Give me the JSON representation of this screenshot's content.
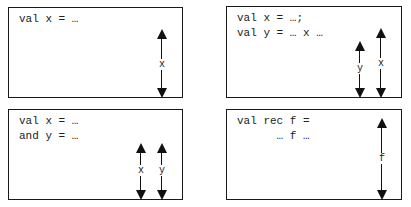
{
  "panels": [
    {
      "id": "simple-val",
      "code": [
        "val x = …"
      ],
      "scopes": [
        {
          "label": "x"
        }
      ]
    },
    {
      "id": "sequential-val",
      "code": [
        "val x = …;",
        "val y = … x …"
      ],
      "scopes": [
        {
          "label": "y"
        },
        {
          "label": "x"
        }
      ]
    },
    {
      "id": "simultaneous-and",
      "code": [
        "val x = …",
        "and y = …"
      ],
      "scopes": [
        {
          "label": "x"
        },
        {
          "label": "y"
        }
      ]
    },
    {
      "id": "recursive-val-rec",
      "code": [
        "val rec f =",
        "      … f …"
      ],
      "scopes": [
        {
          "label": "f"
        }
      ]
    }
  ]
}
